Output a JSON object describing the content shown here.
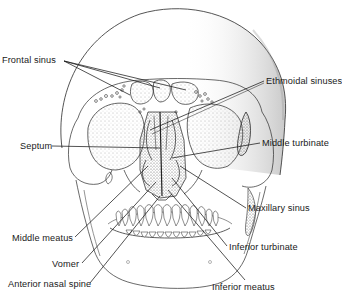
{
  "figure": {
    "labels": [
      {
        "id": "frontal-sinus",
        "text": "Frontal sinus",
        "x": 2,
        "y": 56
      },
      {
        "id": "ethmoidal-sinuses",
        "text": "Ethmoidal sinuses",
        "x": 266,
        "y": 77
      },
      {
        "id": "septum",
        "text": "Septum",
        "x": 20,
        "y": 142
      },
      {
        "id": "middle-turbinate",
        "text": "Middle turbinate",
        "x": 262,
        "y": 139
      },
      {
        "id": "maxillary-sinus",
        "text": "Maxillary sinus",
        "x": 248,
        "y": 204
      },
      {
        "id": "middle-meatus",
        "text": "Middle meatus",
        "x": 12,
        "y": 234
      },
      {
        "id": "inferior-turbinate",
        "text": "Inferior turbinate",
        "x": 229,
        "y": 243
      },
      {
        "id": "vomer",
        "text": "Vomer",
        "x": 52,
        "y": 260
      },
      {
        "id": "anterior-nasal-spine",
        "text": "Anterior nasal spine",
        "x": 8,
        "y": 280
      },
      {
        "id": "inferior-meatus",
        "text": "Inferior meatus",
        "x": 212,
        "y": 283
      }
    ]
  },
  "colors": {
    "ink": "#1a1a1a",
    "stipple": "#555555",
    "background": "#ffffff"
  }
}
